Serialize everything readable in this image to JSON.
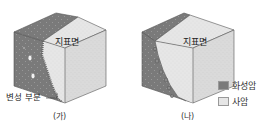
{
  "figures": [
    {
      "id": "ga",
      "caption": "(가)",
      "surface_label": "지표면",
      "callout_label": "변성 부분"
    },
    {
      "id": "na",
      "caption": "(나)",
      "surface_label": "지표면"
    }
  ],
  "legend": {
    "items": [
      {
        "label": "화성암",
        "color": "#7a7a7a"
      },
      {
        "label": "사암",
        "color": "#e6e6e6"
      }
    ]
  },
  "colors": {
    "igneous": "#7a7a7a",
    "igneous_top": "#8a8a8a",
    "sandstone_top": "#ececec",
    "sandstone_right": "#dcdcdc",
    "sandstone_front": "#e4e4e4",
    "edge": "#555555"
  }
}
